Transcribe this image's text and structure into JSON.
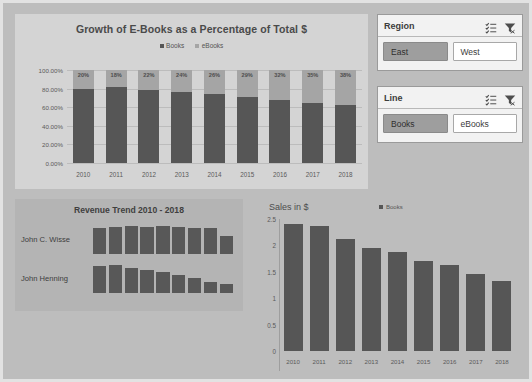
{
  "chart_data": [
    {
      "id": "stacked",
      "type": "bar",
      "title": "Growth of E-Books as a Percentage of Total $",
      "xlabel": "",
      "ylabel": "",
      "ylim": [
        0,
        1
      ],
      "ytick_labels": [
        "100.00%",
        "80.00%",
        "60.00%",
        "40.00%",
        "20.00%",
        "0.00%"
      ],
      "grid": true,
      "legend": [
        "Books",
        "eBooks"
      ],
      "legend_position": "top",
      "categories": [
        "2010",
        "2011",
        "2012",
        "2013",
        "2014",
        "2015",
        "2016",
        "2017",
        "2018"
      ],
      "series": [
        {
          "name": "Books",
          "values": [
            80,
            82,
            78,
            76,
            74,
            71,
            68,
            65,
            62
          ]
        },
        {
          "name": "eBooks",
          "values": [
            20,
            18,
            22,
            24,
            26,
            29,
            32,
            35,
            38
          ]
        }
      ],
      "data_labels": [
        "20%",
        "18%",
        "22%",
        "24%",
        "26%",
        "29%",
        "32%",
        "35%",
        "38%"
      ]
    },
    {
      "id": "trend",
      "type": "bar",
      "title": "Revenue Trend 2010 - 2018",
      "categories": [
        "2010",
        "2011",
        "2012",
        "2013",
        "2014",
        "2015",
        "2016",
        "2017",
        "2018"
      ],
      "series": [
        {
          "name": "John C. Wisse",
          "values": [
            92,
            96,
            98,
            95,
            97,
            94,
            92,
            90,
            62
          ]
        },
        {
          "name": "John Henning",
          "values": [
            96,
            98,
            88,
            80,
            72,
            62,
            52,
            40,
            30
          ]
        }
      ],
      "grid": false,
      "legend_position": "none"
    },
    {
      "id": "sales",
      "type": "bar",
      "title": "Sales in $",
      "xlabel": "",
      "ylabel": "Sales in $",
      "ylim": [
        0,
        2.5
      ],
      "ytick_labels": [
        "2.5",
        "2",
        "1.5",
        "1",
        "0.5",
        "0"
      ],
      "grid": false,
      "legend": [
        "Books"
      ],
      "legend_position": "top",
      "categories": [
        "2010",
        "2011",
        "2012",
        "2013",
        "2014",
        "2015",
        "2016",
        "2017",
        "2018"
      ],
      "series": [
        {
          "name": "Books",
          "values": [
            2.4,
            2.37,
            2.13,
            1.96,
            1.87,
            1.71,
            1.62,
            1.45,
            1.32
          ]
        }
      ]
    }
  ],
  "stacked_chart": {
    "title": "Growth of E-Books as a Percentage of Total $",
    "legend": [
      {
        "label": "Books",
        "color": "#565656"
      },
      {
        "label": "eBooks",
        "color": "#a5a5a5"
      }
    ],
    "y_ticks": [
      "100.00%",
      "80.00%",
      "60.00%",
      "40.00%",
      "20.00%",
      "0.00%"
    ],
    "x_ticks": [
      "2010",
      "2011",
      "2012",
      "2013",
      "2014",
      "2015",
      "2016",
      "2017",
      "2018"
    ],
    "data_labels": [
      "20%",
      "18%",
      "22%",
      "24%",
      "26%",
      "29%",
      "32%",
      "35%",
      "38%"
    ]
  },
  "slicers": [
    {
      "title": "Region",
      "multiselect_icon": "multi-select-icon",
      "clear_icon": "clear-filter-icon",
      "options": [
        {
          "label": "East",
          "selected": true
        },
        {
          "label": "West",
          "selected": false
        }
      ]
    },
    {
      "title": "Line",
      "multiselect_icon": "multi-select-icon",
      "clear_icon": "clear-filter-icon",
      "options": [
        {
          "label": "Books",
          "selected": true
        },
        {
          "label": "eBooks",
          "selected": false
        }
      ]
    }
  ],
  "trend_panel": {
    "title": "Revenue Trend 2010 - 2018",
    "rows": [
      {
        "name": "John C. Wisse"
      },
      {
        "name": "John Henning"
      }
    ]
  },
  "sales_chart": {
    "axis_title": "Sales in $",
    "legend_label": "Books",
    "legend_color": "#565656",
    "y_ticks": [
      "2.5",
      "2",
      "1.5",
      "1",
      "0.5",
      "0"
    ],
    "x_ticks": [
      "2010",
      "2011",
      "2012",
      "2013",
      "2014",
      "2015",
      "2016",
      "2017",
      "2018"
    ]
  },
  "colors": {
    "books": "#565656",
    "ebooks": "#a5a5a5",
    "dashboard_bg": "#bdbdbd",
    "panel_bg": "#d4d4d4",
    "slicer_selected": "#9e9e9e"
  }
}
